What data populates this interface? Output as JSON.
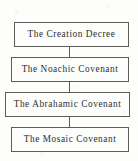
{
  "diagram": {
    "type": "flowchart",
    "orientation": "vertical",
    "background_color": "#fdfdfb",
    "border_color": "#5c5c58",
    "text_color": "#2e2e2c",
    "nodes": [
      {
        "id": "creation-decree",
        "label": "The Creation Decree"
      },
      {
        "id": "noachic-covenant",
        "label": "The Noachic Covenant"
      },
      {
        "id": "abrahamic-covenant",
        "label": "The Abrahamic Covenant"
      },
      {
        "id": "mosaic-covenant",
        "label": "The Mosaic Covenant"
      }
    ],
    "connectors": [
      {
        "id": "connector-1",
        "from": "creation-decree",
        "to": "noachic-covenant"
      },
      {
        "id": "connector-2",
        "from": "noachic-covenant",
        "to": "abrahamic-covenant"
      },
      {
        "id": "connector-3",
        "from": "abrahamic-covenant",
        "to": "mosaic-covenant"
      }
    ]
  }
}
